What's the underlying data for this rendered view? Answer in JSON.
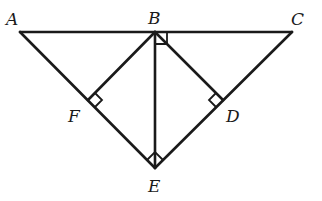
{
  "diagram": {
    "type": "geometry-figure",
    "points": {
      "A": {
        "label": "A",
        "x": 20,
        "y": 32,
        "label_x": 6,
        "label_y": 25
      },
      "B": {
        "label": "B",
        "x": 155,
        "y": 32,
        "label_x": 148,
        "label_y": 24
      },
      "C": {
        "label": "C",
        "x": 292,
        "y": 32,
        "label_x": 291,
        "label_y": 25
      },
      "D": {
        "label": "D",
        "x": 223,
        "y": 100,
        "label_x": 226,
        "label_y": 122
      },
      "E": {
        "label": "E",
        "x": 155,
        "y": 168,
        "label_x": 148,
        "label_y": 192
      },
      "F": {
        "label": "F",
        "x": 88,
        "y": 100,
        "label_x": 68,
        "label_y": 122
      }
    },
    "segments": [
      "AB",
      "BC",
      "AE",
      "CE",
      "BE",
      "BF",
      "BD"
    ],
    "right_angles": [
      {
        "at": "B",
        "between": [
          "BC",
          "BE"
        ]
      },
      {
        "at": "F",
        "between": [
          "FB",
          "FE"
        ]
      },
      {
        "at": "D",
        "between": [
          "DB",
          "DE"
        ]
      },
      {
        "at": "E",
        "between": [
          "EF",
          "ED"
        ]
      }
    ]
  }
}
